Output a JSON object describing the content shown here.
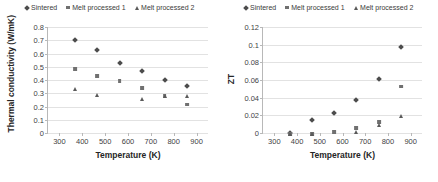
{
  "figure": {
    "panels": [
      {
        "id": "thermal-conductivity",
        "legend": [
          {
            "label": "Sintered",
            "marker": "diamond-marker-icon"
          },
          {
            "label": "Melt processed 1",
            "marker": "square-marker-icon"
          },
          {
            "label": "Melt processed 2",
            "marker": "triangle-marker-icon"
          }
        ]
      },
      {
        "id": "zt",
        "legend": [
          {
            "label": "Sintered",
            "marker": "diamond-marker-icon"
          },
          {
            "label": "Melt processed 1",
            "marker": "square-marker-icon"
          },
          {
            "label": "Melt processed 2",
            "marker": "triangle-marker-icon"
          }
        ]
      }
    ]
  },
  "chart_data": [
    {
      "type": "scatter",
      "title": "",
      "xlabel": "Temperature (K)",
      "ylabel": "Thermal conductivity (W/mK)",
      "xlim": [
        250,
        950
      ],
      "ylim": [
        0,
        0.8
      ],
      "xticks": [
        300,
        400,
        500,
        600,
        700,
        800,
        900
      ],
      "yticks": [
        0,
        0.1,
        0.2,
        0.3,
        0.4,
        0.5,
        0.6,
        0.7,
        0.8
      ],
      "ytick_labels": [
        "0",
        "0.1",
        "0.2",
        "0.3",
        "0.4",
        "0.5",
        "0.6",
        "0.7",
        "0.8"
      ],
      "xtick_labels": [
        "300",
        "400",
        "500",
        "600",
        "700",
        "800",
        "900"
      ],
      "grid": true,
      "legend_position": "top-center",
      "series": [
        {
          "name": "Sintered",
          "marker": "diamond",
          "color": "#4c4c4c",
          "x": [
            370,
            465,
            563,
            660,
            760,
            858
          ],
          "y": [
            0.725,
            0.648,
            0.553,
            0.487,
            0.419,
            0.378
          ]
        },
        {
          "name": "Melt processed 1",
          "marker": "square",
          "color": "#707070",
          "x": [
            370,
            465,
            563,
            660,
            760,
            858
          ],
          "y": [
            0.508,
            0.455,
            0.413,
            0.366,
            0.3,
            0.238
          ]
        },
        {
          "name": "Melt processed 2",
          "marker": "triangle",
          "color": "#5a5a5a",
          "x": [
            370,
            465,
            660,
            760,
            858
          ],
          "y": [
            0.356,
            0.31,
            0.283,
            0.305,
            0.303
          ]
        }
      ]
    },
    {
      "type": "scatter",
      "title": "",
      "xlabel": "Temperature (K)",
      "ylabel": "ZT",
      "xlim": [
        250,
        950
      ],
      "ylim": [
        0,
        0.12
      ],
      "xticks": [
        300,
        400,
        500,
        600,
        700,
        800,
        900
      ],
      "yticks": [
        0,
        0.02,
        0.04,
        0.06,
        0.08,
        0.1,
        0.12
      ],
      "ytick_labels": [
        "0",
        "0.02",
        "0.04",
        "0.06",
        "0.08",
        "0.1",
        "0.12"
      ],
      "xtick_labels": [
        "300",
        "400",
        "500",
        "600",
        "700",
        "800",
        "900"
      ],
      "grid": true,
      "legend_position": "top-center",
      "series": [
        {
          "name": "Sintered",
          "marker": "diamond",
          "color": "#4c4c4c",
          "x": [
            370,
            465,
            563,
            660,
            760,
            858
          ],
          "y": [
            0.0035,
            0.0182,
            0.0257,
            0.041,
            0.0642,
            0.1008
          ]
        },
        {
          "name": "Melt processed 1",
          "marker": "square",
          "color": "#707070",
          "x": [
            370,
            465,
            563,
            660,
            760,
            858
          ],
          "y": [
            0.0028,
            0.0022,
            0.0049,
            0.009,
            0.0158,
            0.0562
          ]
        },
        {
          "name": "Melt processed 2",
          "marker": "triangle",
          "color": "#5a5a5a",
          "x": [
            370,
            465,
            660,
            760,
            858
          ],
          "y": [
            0.0018,
            0.0018,
            0.0042,
            0.013,
            0.0225
          ]
        }
      ]
    }
  ]
}
